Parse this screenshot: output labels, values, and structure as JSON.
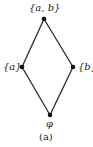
{
  "diagram": {
    "type": "hasse-diagram",
    "caption": "(a)",
    "nodes": [
      {
        "id": "ab",
        "label": "{a, b}",
        "x": 44,
        "y": 19
      },
      {
        "id": "a",
        "label": "{a}",
        "x": 22,
        "y": 67
      },
      {
        "id": "b",
        "label": "{b}",
        "x": 73,
        "y": 67
      },
      {
        "id": "empty",
        "label": "φ",
        "x": 50,
        "y": 115
      }
    ],
    "edges": [
      {
        "from": "ab",
        "to": "a"
      },
      {
        "from": "ab",
        "to": "b"
      },
      {
        "from": "a",
        "to": "empty"
      },
      {
        "from": "b",
        "to": "empty"
      }
    ],
    "colors": {
      "line": "#2a2a2a",
      "node": "#111111",
      "text": "#222222"
    }
  }
}
